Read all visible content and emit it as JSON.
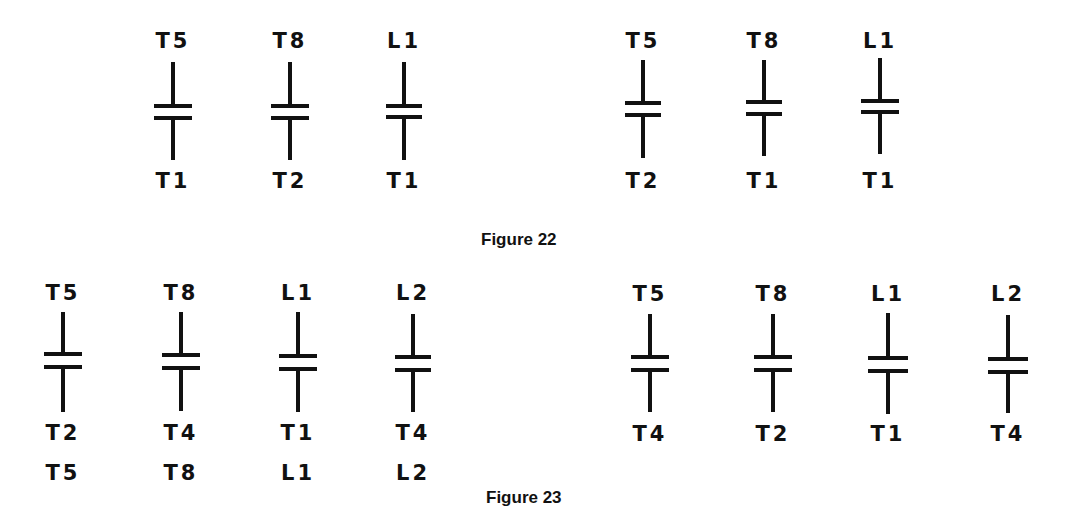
{
  "figures": [
    {
      "caption": "Figure 22",
      "groups": [
        {
          "contacts": [
            {
              "top": "T5",
              "bottom": "T1"
            },
            {
              "top": "T8",
              "bottom": "T2"
            },
            {
              "top": "L1",
              "bottom": "T1"
            }
          ]
        },
        {
          "contacts": [
            {
              "top": "T5",
              "bottom": "T2"
            },
            {
              "top": "T8",
              "bottom": "T1"
            },
            {
              "top": "L1",
              "bottom": "T1"
            }
          ]
        }
      ]
    },
    {
      "caption": "Figure 23",
      "groups": [
        {
          "contacts": [
            {
              "top": "T5",
              "bottom": "T2",
              "extra": "T5"
            },
            {
              "top": "T8",
              "bottom": "T4",
              "extra": "T8"
            },
            {
              "top": "L1",
              "bottom": "T1",
              "extra": "L1"
            },
            {
              "top": "L2",
              "bottom": "T4",
              "extra": "L2"
            }
          ]
        },
        {
          "contacts": [
            {
              "top": "T5",
              "bottom": "T4"
            },
            {
              "top": "T8",
              "bottom": "T2"
            },
            {
              "top": "L1",
              "bottom": "T1"
            },
            {
              "top": "L2",
              "bottom": "T4"
            }
          ]
        }
      ]
    }
  ],
  "colors": {
    "ink": "#111111",
    "background": "#ffffff"
  }
}
